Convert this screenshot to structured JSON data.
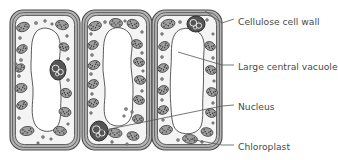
{
  "diagram": {
    "cell_count": 3,
    "labels": [
      {
        "id": "cellulose-cell-wall",
        "text": "Cellulose cell wall",
        "text_x": 238,
        "text_y": 22,
        "leader": "M 234 19 L 222 23 L 205 11"
      },
      {
        "id": "large-central-vacuole",
        "text": "Large central vacuole",
        "text_x": 238,
        "text_y": 67,
        "leader": "M 234 65 L 222 65 L 178 52"
      },
      {
        "id": "nucleus",
        "text": "Nucleus",
        "text_x": 238,
        "text_y": 107,
        "leader": "M 234 105 L 222 106 L 100 131"
      },
      {
        "id": "chloroplast",
        "text": "Chloroplast",
        "text_x": 238,
        "text_y": 147,
        "leader": "M 234 145 L 222 145 L 190 139"
      }
    ],
    "colors": {
      "wall_fill": "#b5b5b5",
      "wall_stroke": "#4a4a4a",
      "cytoplasm_fill": "#f4f4f4",
      "vacuole_fill": "#ffffff",
      "chloroplast_fill": "#9e9e9e",
      "chloroplast_stroke": "#3f3f3f",
      "nucleus_fill": "#555555",
      "nucleus_stroke": "#2b2b2b",
      "granule_fill": "#8d8d8d",
      "text_color": "#4a4a4a",
      "leader_color": "#555555"
    },
    "cells": [
      {
        "id": "cell-1",
        "x": 10,
        "y": 10,
        "w": 70,
        "h": 140,
        "vacuole_path": "M 36 32 C 30 40 32 52 31 62 C 30 74 34 84 33 96 C 32 108 31 118 36 126 C 42 133 52 133 57 127 C 62 120 60 110 61 100 C 62 88 58 76 59 64 C 60 52 62 42 57 34 C 51 27 41 26 36 32 Z",
        "nucleus": {
          "cx": 58,
          "cy": 70,
          "rx": 8,
          "ry": 10
        },
        "chloroplasts": [
          {
            "cx": 23,
            "cy": 27,
            "rx": 6.5,
            "ry": 4.5,
            "rot": -18
          },
          {
            "cx": 62,
            "cy": 25,
            "rx": 6.5,
            "ry": 4.5,
            "rot": 14
          },
          {
            "cx": 22,
            "cy": 49,
            "rx": 5.5,
            "ry": 4,
            "rot": -28
          },
          {
            "cx": 64,
            "cy": 47,
            "rx": 5,
            "ry": 4,
            "rot": 22
          },
          {
            "cx": 21,
            "cy": 88,
            "rx": 6,
            "ry": 4.5,
            "rot": -10
          },
          {
            "cx": 66,
            "cy": 93,
            "rx": 5.5,
            "ry": 4.5,
            "rot": 16
          },
          {
            "cx": 22,
            "cy": 105,
            "rx": 5.5,
            "ry": 4,
            "rot": -24
          },
          {
            "cx": 65,
            "cy": 112,
            "rx": 6,
            "ry": 4.5,
            "rot": 12
          },
          {
            "cx": 27,
            "cy": 131,
            "rx": 7,
            "ry": 4.5,
            "rot": -8
          },
          {
            "cx": 60,
            "cy": 131,
            "rx": 6.5,
            "ry": 4.5,
            "rot": 10
          },
          {
            "cx": 20,
            "cy": 68,
            "rx": 5,
            "ry": 3.8,
            "rot": -30
          }
        ],
        "granules": [
          {
            "cx": 36,
            "cy": 23,
            "r": 1.6
          },
          {
            "cx": 45,
            "cy": 21,
            "r": 1.4
          },
          {
            "cx": 52,
            "cy": 24,
            "r": 1.3
          },
          {
            "cx": 20,
            "cy": 38,
            "r": 1.5
          },
          {
            "cx": 67,
            "cy": 36,
            "r": 1.4
          },
          {
            "cx": 21,
            "cy": 60,
            "r": 1.6
          },
          {
            "cx": 16,
            "cy": 64,
            "r": 1.3
          },
          {
            "cx": 19,
            "cy": 76,
            "r": 1.5
          },
          {
            "cx": 68,
            "cy": 59,
            "r": 1.4
          },
          {
            "cx": 68,
            "cy": 80,
            "r": 1.5
          },
          {
            "cx": 19,
            "cy": 118,
            "r": 1.5
          },
          {
            "cx": 43,
            "cy": 137,
            "r": 1.5
          },
          {
            "cx": 51,
            "cy": 139,
            "r": 1.3
          },
          {
            "cx": 38,
            "cy": 143,
            "r": 1.3
          },
          {
            "cx": 68,
            "cy": 124,
            "r": 1.3
          }
        ]
      },
      {
        "id": "cell-2",
        "x": 82,
        "y": 10,
        "w": 70,
        "h": 140,
        "vacuole_path": "M 108 32 C 102 40 104 52 103 62 C 102 74 106 84 105 96 C 104 108 103 116 108 122 C 114 128 124 127 129 121 C 134 114 132 104 133 94 C 134 82 130 70 131 58 C 132 46 134 40 129 33 C 123 26 113 26 108 32 Z",
        "nucleus": {
          "cx": 99,
          "cy": 131,
          "rx": 9,
          "ry": 10
        },
        "chloroplasts": [
          {
            "cx": 95,
            "cy": 26,
            "rx": 6.5,
            "ry": 4.5,
            "rot": -16
          },
          {
            "cx": 116,
            "cy": 23,
            "rx": 6.5,
            "ry": 4.5,
            "rot": 6
          },
          {
            "cx": 133,
            "cy": 24,
            "rx": 6,
            "ry": 4.5,
            "rot": 16
          },
          {
            "cx": 93,
            "cy": 45,
            "rx": 5.5,
            "ry": 4.2,
            "rot": -24
          },
          {
            "cx": 137,
            "cy": 44,
            "rx": 5.5,
            "ry": 4.2,
            "rot": 20
          },
          {
            "cx": 94,
            "cy": 65,
            "rx": 6,
            "ry": 4.2,
            "rot": -18
          },
          {
            "cx": 139,
            "cy": 62,
            "rx": 5.5,
            "ry": 4.2,
            "rot": 18
          },
          {
            "cx": 93,
            "cy": 84,
            "rx": 5.5,
            "ry": 4.2,
            "rot": -22
          },
          {
            "cx": 140,
            "cy": 80,
            "rx": 5.5,
            "ry": 4.2,
            "rot": 14
          },
          {
            "cx": 93,
            "cy": 103,
            "rx": 5.5,
            "ry": 4.2,
            "rot": -14
          },
          {
            "cx": 139,
            "cy": 100,
            "rx": 5.5,
            "ry": 4.2,
            "rot": 20
          },
          {
            "cx": 138,
            "cy": 119,
            "rx": 5.5,
            "ry": 4.2,
            "rot": 10
          },
          {
            "cx": 115,
            "cy": 133,
            "rx": 7,
            "ry": 4.5,
            "rot": 8
          },
          {
            "cx": 133,
            "cy": 136,
            "rx": 6,
            "ry": 4.2,
            "rot": 14
          }
        ],
        "granules": [
          {
            "cx": 105,
            "cy": 22,
            "r": 1.5
          },
          {
            "cx": 125,
            "cy": 21,
            "r": 1.3
          },
          {
            "cx": 142,
            "cy": 32,
            "r": 1.4
          },
          {
            "cx": 91,
            "cy": 34,
            "r": 1.4
          },
          {
            "cx": 92,
            "cy": 55,
            "r": 1.5
          },
          {
            "cx": 142,
            "cy": 53,
            "r": 1.4
          },
          {
            "cx": 91,
            "cy": 74,
            "r": 1.5
          },
          {
            "cx": 143,
            "cy": 71,
            "r": 1.3
          },
          {
            "cx": 92,
            "cy": 94,
            "r": 1.4
          },
          {
            "cx": 142,
            "cy": 91,
            "r": 1.4
          },
          {
            "cx": 91,
            "cy": 113,
            "r": 1.4
          },
          {
            "cx": 126,
            "cy": 109,
            "r": 1.6
          },
          {
            "cx": 132,
            "cy": 112,
            "r": 1.4
          },
          {
            "cx": 124,
            "cy": 116,
            "r": 1.3
          },
          {
            "cx": 112,
            "cy": 142,
            "r": 1.4
          },
          {
            "cx": 127,
            "cy": 144,
            "r": 1.3
          }
        ]
      },
      {
        "id": "cell-3",
        "x": 152,
        "y": 10,
        "w": 70,
        "h": 140,
        "vacuole_path": "M 175 34 C 170 42 172 54 171 66 C 170 80 170 96 171 108 C 172 120 172 128 179 132 C 188 136 198 133 201 126 C 204 118 202 106 203 94 C 204 78 203 62 204 50 C 205 40 202 33 195 30 C 186 27 179 28 175 34 Z",
        "nucleus": {
          "cx": 196,
          "cy": 24,
          "rx": 9,
          "ry": 8
        },
        "chloroplasts": [
          {
            "cx": 168,
            "cy": 24,
            "rx": 7,
            "ry": 4.5,
            "rot": -12
          },
          {
            "cx": 164,
            "cy": 46,
            "rx": 5.5,
            "ry": 4.2,
            "rot": -26
          },
          {
            "cx": 210,
            "cy": 46,
            "rx": 5.5,
            "ry": 4.2,
            "rot": 24
          },
          {
            "cx": 163,
            "cy": 68,
            "rx": 5.5,
            "ry": 4.2,
            "rot": -18
          },
          {
            "cx": 211,
            "cy": 70,
            "rx": 5.5,
            "ry": 4.2,
            "rot": 18
          },
          {
            "cx": 163,
            "cy": 90,
            "rx": 5.5,
            "ry": 4.2,
            "rot": -22
          },
          {
            "cx": 212,
            "cy": 92,
            "rx": 5.5,
            "ry": 4.2,
            "rot": 16
          },
          {
            "cx": 163,
            "cy": 110,
            "rx": 5.5,
            "ry": 4.2,
            "rot": -16
          },
          {
            "cx": 211,
            "cy": 113,
            "rx": 5.5,
            "ry": 4.2,
            "rot": 20
          },
          {
            "cx": 166,
            "cy": 130,
            "rx": 6.5,
            "ry": 4.5,
            "rot": -10
          },
          {
            "cx": 190,
            "cy": 139,
            "rx": 7.5,
            "ry": 4.5,
            "rot": 6
          },
          {
            "cx": 207,
            "cy": 132,
            "rx": 6,
            "ry": 4.2,
            "rot": 14
          }
        ],
        "granules": [
          {
            "cx": 180,
            "cy": 22,
            "r": 1.5
          },
          {
            "cx": 207,
            "cy": 20,
            "r": 1.4
          },
          {
            "cx": 162,
            "cy": 34,
            "r": 1.4
          },
          {
            "cx": 213,
            "cy": 34,
            "r": 1.3
          },
          {
            "cx": 162,
            "cy": 57,
            "r": 1.5
          },
          {
            "cx": 213,
            "cy": 58,
            "r": 1.4
          },
          {
            "cx": 162,
            "cy": 79,
            "r": 1.5
          },
          {
            "cx": 214,
            "cy": 81,
            "r": 1.3
          },
          {
            "cx": 162,
            "cy": 100,
            "r": 1.4
          },
          {
            "cx": 213,
            "cy": 103,
            "r": 1.4
          },
          {
            "cx": 163,
            "cy": 120,
            "r": 1.4
          },
          {
            "cx": 178,
            "cy": 140,
            "r": 1.5
          },
          {
            "cx": 202,
            "cy": 142,
            "r": 1.4
          },
          {
            "cx": 213,
            "cy": 123,
            "r": 1.3
          }
        ]
      }
    ]
  }
}
